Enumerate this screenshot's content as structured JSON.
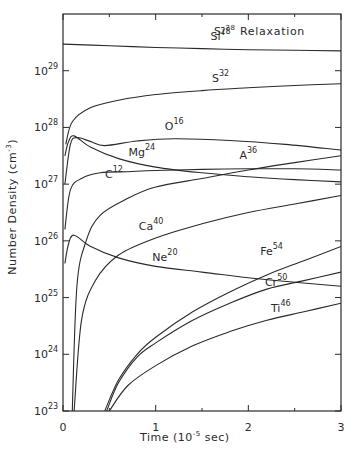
{
  "chart_data": {
    "type": "line",
    "title": "Si28 Relaxation",
    "xlabel": "Time (10^-5 sec)",
    "ylabel": "Number Density (cm^-3)",
    "xlim": [
      0,
      3
    ],
    "ylim_log10": [
      23,
      30
    ],
    "yscale": "log",
    "grid": false,
    "legend": "inline labels on curves",
    "x_ticks": [
      "0",
      "1",
      "2",
      "3"
    ],
    "y_ticks": [
      "10^23",
      "10^24",
      "10^25",
      "10^26",
      "10^27",
      "10^28",
      "10^29"
    ],
    "series": [
      {
        "name": "Si28",
        "label_base": "Si",
        "label_sup": "28",
        "t": [
          0,
          0.5,
          1,
          1.5,
          2,
          2.5,
          3
        ],
        "log10_n": [
          29.47,
          29.44,
          29.41,
          29.39,
          29.37,
          29.36,
          29.35
        ]
      },
      {
        "name": "S32",
        "label_base": "S",
        "label_sup": "32",
        "t": [
          0.03,
          0.1,
          0.3,
          0.6,
          1,
          1.5,
          2,
          2.5,
          3
        ],
        "log10_n": [
          27.7,
          28.1,
          28.35,
          28.48,
          28.58,
          28.65,
          28.7,
          28.74,
          28.77
        ]
      },
      {
        "name": "O16",
        "label_base": "O",
        "label_sup": "16",
        "t": [
          0.02,
          0.08,
          0.15,
          0.3,
          0.45,
          0.8,
          1.2,
          1.8,
          2.4,
          3
        ],
        "log10_n": [
          27.0,
          27.7,
          27.82,
          27.75,
          27.68,
          27.76,
          27.8,
          27.77,
          27.7,
          27.6
        ]
      },
      {
        "name": "Mg24",
        "label_base": "Mg",
        "label_sup": "24",
        "t": [
          0.02,
          0.06,
          0.12,
          0.3,
          0.6,
          1,
          1.5,
          2,
          2.5,
          3
        ],
        "log10_n": [
          27.5,
          27.75,
          27.85,
          27.65,
          27.45,
          27.3,
          27.2,
          27.13,
          27.08,
          27.04
        ]
      },
      {
        "name": "C12",
        "label_base": "C",
        "label_sup": "12",
        "t": [
          0.02,
          0.08,
          0.2,
          0.4,
          0.7,
          1,
          1.5,
          2,
          2.5,
          3
        ],
        "log10_n": [
          26.2,
          26.9,
          27.1,
          27.2,
          27.22,
          27.24,
          27.26,
          27.27,
          27.27,
          27.25
        ]
      },
      {
        "name": "A36",
        "label_base": "A",
        "label_sup": "36",
        "t": [
          0.1,
          0.15,
          0.25,
          0.4,
          0.7,
          1,
          1.5,
          2,
          2.5,
          3
        ],
        "log10_n": [
          23.0,
          25.2,
          26.0,
          26.45,
          26.75,
          26.95,
          27.1,
          27.25,
          27.38,
          27.5
        ]
      },
      {
        "name": "Ca40",
        "label_base": "Ca",
        "label_sup": "40",
        "t": [
          0.12,
          0.2,
          0.35,
          0.6,
          1,
          1.5,
          2,
          2.5,
          3
        ],
        "log10_n": [
          23.0,
          24.6,
          25.3,
          25.75,
          26.05,
          26.3,
          26.5,
          26.65,
          26.8
        ]
      },
      {
        "name": "Ne20",
        "label_base": "Ne",
        "label_sup": "20",
        "t": [
          0.02,
          0.06,
          0.12,
          0.3,
          0.6,
          1,
          1.5,
          2,
          2.5,
          3
        ],
        "log10_n": [
          25.6,
          25.95,
          26.1,
          25.9,
          25.7,
          25.55,
          25.45,
          25.35,
          25.27,
          25.2
        ]
      },
      {
        "name": "Fe54",
        "label_base": "Fe",
        "label_sup": "54",
        "t": [
          0.45,
          0.6,
          0.8,
          1,
          1.4,
          1.8,
          2.2,
          2.6,
          3
        ],
        "log10_n": [
          23.0,
          23.55,
          24.0,
          24.3,
          24.75,
          25.1,
          25.4,
          25.65,
          25.9
        ]
      },
      {
        "name": "Cr50",
        "label_base": "Cr",
        "label_sup": "50",
        "t": [
          0.47,
          0.6,
          0.8,
          1,
          1.4,
          1.8,
          2.2,
          2.6,
          3
        ],
        "log10_n": [
          23.0,
          23.5,
          23.95,
          24.2,
          24.6,
          24.9,
          25.15,
          25.3,
          25.45
        ]
      },
      {
        "name": "Ti46",
        "label_base": "Ti",
        "label_sup": "46",
        "t": [
          0.5,
          0.7,
          1,
          1.4,
          1.8,
          2.2,
          2.6,
          3
        ],
        "log10_n": [
          23.0,
          23.45,
          23.8,
          24.15,
          24.4,
          24.6,
          24.75,
          24.9
        ]
      }
    ],
    "curve_labels": [
      {
        "series": "Si28",
        "t": 1.7,
        "log10_n": 29.55
      },
      {
        "series": "S32",
        "t": 1.7,
        "log10_n": 28.8
      },
      {
        "series": "O16",
        "t": 1.2,
        "log10_n": 27.95
      },
      {
        "series": "Mg24",
        "t": 0.85,
        "log10_n": 27.5
      },
      {
        "series": "C12",
        "t": 0.55,
        "log10_n": 27.1
      },
      {
        "series": "A36",
        "t": 2.0,
        "log10_n": 27.45
      },
      {
        "series": "Ca40",
        "t": 0.95,
        "log10_n": 26.2
      },
      {
        "series": "Ne20",
        "t": 1.1,
        "log10_n": 25.65
      },
      {
        "series": "Fe54",
        "t": 2.25,
        "log10_n": 25.75
      },
      {
        "series": "Cr50",
        "t": 2.3,
        "log10_n": 25.2
      },
      {
        "series": "Ti46",
        "t": 2.35,
        "log10_n": 24.75
      }
    ]
  },
  "labels": {
    "title_base": "Si",
    "title_sup": "28",
    "title_rest": " Relaxation",
    "ylabel_main": "Number  Density  (cm",
    "ylabel_sup": "-3",
    "ylabel_end": ")",
    "xlabel_main": "Time  (10",
    "xlabel_sup": "-5",
    "xlabel_end": " sec)"
  },
  "colors": {
    "line": "#2a2a2a",
    "background": "#ffffff"
  }
}
